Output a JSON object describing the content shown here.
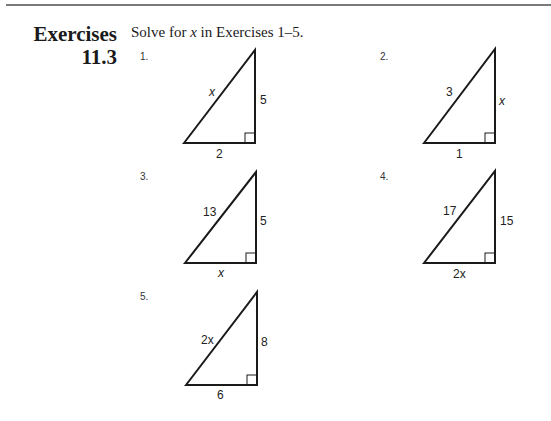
{
  "header": {
    "title_line1": "Exercises",
    "title_line2": "11.3",
    "instruction_prefix": "Solve for ",
    "instruction_var": "x",
    "instruction_suffix": " in Exercises 1–5."
  },
  "exercises": [
    {
      "number": "1.",
      "hypotenuse": "x",
      "vertical": "5",
      "base": "2"
    },
    {
      "number": "2.",
      "hypotenuse": "3",
      "vertical": "x",
      "base": "1"
    },
    {
      "number": "3.",
      "hypotenuse": "13",
      "vertical": "5",
      "base": "x"
    },
    {
      "number": "4.",
      "hypotenuse": "17",
      "vertical": "15",
      "base": "2x"
    },
    {
      "number": "5.",
      "hypotenuse": "2x",
      "vertical": "8",
      "base": "6"
    }
  ]
}
